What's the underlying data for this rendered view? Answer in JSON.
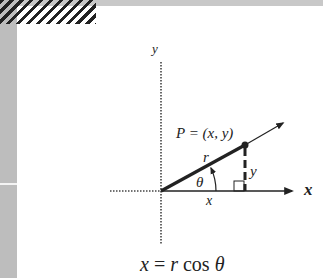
{
  "diagram": {
    "axes": {
      "x_label": "x",
      "y_label": "y"
    },
    "point_label": "P = (x, y)",
    "segment_labels": {
      "radius": "r",
      "adjacent": "x",
      "opposite": "y",
      "angle": "θ"
    },
    "formula": {
      "lhs": "x",
      "eq": " = ",
      "r": "r",
      "cos": " cos ",
      "theta": "θ"
    },
    "colors": {
      "ink": "#222222",
      "frame_gray": "#bdbdbd",
      "background": "#ffffff"
    }
  }
}
